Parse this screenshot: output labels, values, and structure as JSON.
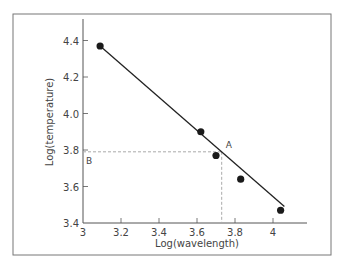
{
  "chart_data": {
    "type": "scatter",
    "title": "",
    "xlabel": "Log(wavelength)",
    "ylabel": "Log(temperature)",
    "xlim": [
      3.0,
      4.13
    ],
    "ylim": [
      3.4,
      4.52
    ],
    "xticks": [
      3,
      3.2,
      3.4,
      3.6,
      3.8,
      4
    ],
    "xtick_labels": [
      "3",
      "3.2",
      "3.4",
      "3.6",
      "3.8",
      "4"
    ],
    "yticks": [
      3.4,
      3.6,
      3.8,
      4.0,
      4.2,
      4.4
    ],
    "ytick_labels": [
      "3.4",
      "3.6",
      "3.8",
      "4.0",
      "4.2",
      "4.4"
    ],
    "grid": false,
    "legend": null,
    "series": [
      {
        "name": "data points",
        "x": [
          3.09,
          3.62,
          3.7,
          3.83,
          4.04
        ],
        "y": [
          4.37,
          3.9,
          3.77,
          3.64,
          3.47
        ]
      },
      {
        "name": "fit line",
        "x": [
          3.09,
          4.06
        ],
        "y": [
          4.37,
          3.49
        ]
      }
    ],
    "annotations": [
      {
        "label": "A",
        "x": 3.73,
        "y": 3.79,
        "note": "point on fit line with dashed projections"
      },
      {
        "label": "B",
        "x": 3.0,
        "y": 3.79,
        "note": "projection of A onto y-axis"
      }
    ]
  },
  "colors": {
    "line": "#222222",
    "point": "#1a1a1a",
    "axis": "#555555",
    "dashed": "#aaaaaa",
    "frame": "#777777"
  }
}
